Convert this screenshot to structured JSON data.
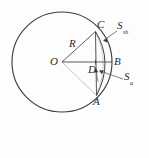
{
  "figure": {
    "background_color": "#fdfdfd",
    "stroke_color": "#3a3a3a",
    "label_color": "#2b2b2b"
  },
  "geometry": {
    "circle": {
      "center_x": 62,
      "center_y": 62,
      "radius": 50
    },
    "points": {
      "O": {
        "x": 62,
        "y": 62,
        "label": "O"
      },
      "C": {
        "x": 95,
        "y": 31,
        "label": "C"
      },
      "A": {
        "x": 96,
        "y": 95,
        "label": "A"
      },
      "D": {
        "x": 95,
        "y": 62,
        "label": "D"
      },
      "B": {
        "x": 112,
        "y": 62,
        "label": "B"
      }
    },
    "radius_label": "R"
  },
  "labels": {
    "point_O": "O",
    "point_C": "C",
    "point_A": "A",
    "point_D": "D",
    "point_B": "B",
    "radius": "R",
    "segment_area": {
      "base": "S",
      "sub": "sh"
    },
    "sector_area": {
      "base": "S",
      "sub": "a"
    }
  },
  "annotations": [
    {
      "name": "segment-area-callout",
      "base": "S",
      "sub": "sh",
      "label_x": 118,
      "label_y": 24,
      "leader_from_x": 117,
      "leader_from_y": 31,
      "leader_to_x": 103,
      "leader_to_y": 41
    },
    {
      "name": "sector-area-callout",
      "base": "S",
      "sub": "a",
      "label_x": 125,
      "label_y": 75,
      "leader_from_x": 124,
      "leader_from_y": 79,
      "leader_to_x": 99,
      "leader_to_y": 71
    }
  ]
}
